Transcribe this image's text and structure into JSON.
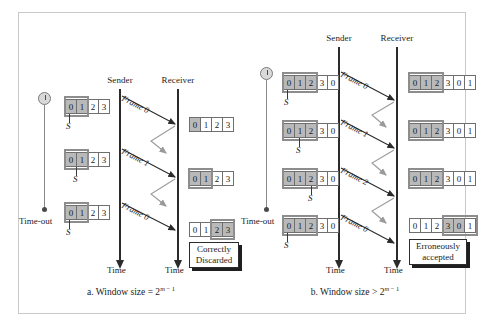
{
  "figure": {
    "panels": [
      {
        "id": "a",
        "caption_prefix": "a. Window size = 2",
        "caption_exp_m": "m",
        "caption_exp_rest": " − 1",
        "sender_label": "Sender",
        "receiver_label": "Receiver",
        "sender_time_label": "Time",
        "receiver_time_label": "Time",
        "timeout_label": "Time-out",
        "sender_pointer_label": "S",
        "sender_windows": [
          {
            "cells": [
              "0",
              "1",
              "2",
              "3"
            ],
            "shaded": [
              0,
              1
            ]
          },
          {
            "cells": [
              "0",
              "1",
              "2",
              "3"
            ],
            "shaded": [
              0,
              1
            ]
          },
          {
            "cells": [
              "0",
              "1",
              "2",
              "3"
            ],
            "shaded": [
              0,
              1
            ]
          }
        ],
        "receiver_windows": [
          {
            "cells": [
              "0",
              "1",
              "2",
              "3"
            ],
            "shaded": [
              0
            ]
          },
          {
            "cells": [
              "0",
              "1",
              "2",
              "3"
            ],
            "shaded": [
              0,
              1
            ]
          },
          {
            "cells": [
              "0",
              "1",
              "2",
              "3"
            ],
            "shaded": [
              2,
              3
            ]
          }
        ],
        "frames": [
          "Frame 0",
          "Frame 1",
          "Frame 0"
        ],
        "note": "Correctly Discarded",
        "note_line1": "Correctly",
        "note_line2": "Discarded"
      },
      {
        "id": "b",
        "caption_prefix": "b. Window size > 2",
        "caption_exp_m": "m",
        "caption_exp_rest": " − 1",
        "sender_label": "Sender",
        "receiver_label": "Receiver",
        "sender_time_label": "Time",
        "receiver_time_label": "Time",
        "timeout_label": "Time-out",
        "sender_pointer_label": "S",
        "sender_windows": [
          {
            "cells": [
              "0",
              "1",
              "2",
              "3",
              "0"
            ],
            "shaded": [
              0,
              1,
              2
            ]
          },
          {
            "cells": [
              "0",
              "1",
              "2",
              "3",
              "0"
            ],
            "shaded": [
              0,
              1,
              2
            ]
          },
          {
            "cells": [
              "0",
              "1",
              "2",
              "3",
              "0"
            ],
            "shaded": [
              0,
              1,
              2
            ]
          },
          {
            "cells": [
              "0",
              "1",
              "2",
              "3",
              "0"
            ],
            "shaded": [
              0,
              1,
              2
            ]
          }
        ],
        "receiver_windows": [
          {
            "cells": [
              "0",
              "1",
              "2",
              "3",
              "0",
              "1"
            ],
            "shaded": [
              0,
              1,
              2
            ]
          },
          {
            "cells": [
              "0",
              "1",
              "2",
              "3",
              "0",
              "1"
            ],
            "shaded": [
              0,
              1,
              2
            ]
          },
          {
            "cells": [
              "0",
              "1",
              "2",
              "3",
              "0",
              "1"
            ],
            "shaded": [
              0,
              1,
              2
            ]
          },
          {
            "cells": [
              "0",
              "1",
              "2",
              "3",
              "0",
              "1"
            ],
            "shaded": [
              3,
              4
            ]
          }
        ],
        "frames": [
          "Frame 0",
          "Frame 1",
          "Frame 2",
          "Frame 0"
        ],
        "note": "Erroneously accepted",
        "note_line1": "Erroneously",
        "note_line2": "accepted"
      }
    ],
    "colors": {
      "shade": "#b9b9b9",
      "line": "#2b2b2b",
      "window_frame": "#8d8d8d",
      "border": "#c9c9c9",
      "ack_arrow": "#9a9a9a"
    }
  }
}
